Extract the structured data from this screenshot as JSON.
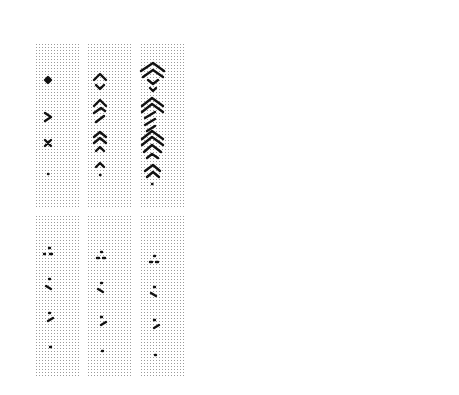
{
  "figure": {
    "panel_a": {
      "label": "a",
      "top_row": {
        "strip_labels": [
          "1",
          "2",
          "3"
        ],
        "description": "Dotted background strips showing growth of V/chevron patterns from seeds over steps 1-3"
      },
      "bottom_row": {
        "strip_labels": [
          "1",
          "2",
          "3"
        ],
        "description": "Dotted background strips showing small dot/dash seeds at steps 1-3"
      }
    },
    "panel_b": {
      "label": "b",
      "top_row": {
        "strip_labels": [
          "16",
          "17",
          "18",
          "17",
          "20"
        ]
      },
      "bottom_row": {
        "strip_labels": [
          "21",
          "22",
          "23",
          "24",
          "25"
        ]
      },
      "description": "Dense zigzag/chevron stripe patterns in vertical strips"
    }
  },
  "colors": {
    "ink": "#111111",
    "dot_grid": "#9a9a9a",
    "background": "#ffffff"
  }
}
